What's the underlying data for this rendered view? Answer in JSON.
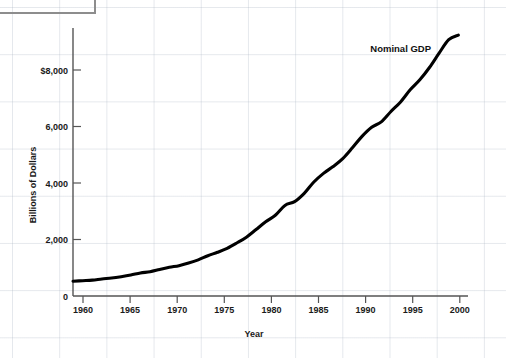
{
  "figure": {
    "background_color": "#ffffff",
    "grid_color": "#aab4c3",
    "line_color": "#000000",
    "text_color": "#1a1a1a"
  },
  "top_box": {
    "name": "cropped-box-outline",
    "border_color": "#8d8d8d"
  },
  "chart_data": {
    "type": "line",
    "title": "",
    "subtitle": "",
    "xlabel": "Year",
    "ylabel": "Billions of Dollars",
    "xlim": [
      1959,
      2000
    ],
    "ylim": [
      0,
      9500
    ],
    "xticks": [
      1960,
      1965,
      1970,
      1975,
      1980,
      1985,
      1990,
      1995,
      2000
    ],
    "xticklabels": [
      "1960",
      "1965",
      "1970",
      "1975",
      "1980",
      "1985",
      "1990",
      "1995",
      "2000"
    ],
    "yticks": [
      0,
      2000,
      4000,
      6000,
      8000
    ],
    "yticklabels": [
      "0",
      "2,000",
      "4,000",
      "6,000",
      "$8,000"
    ],
    "grid": true,
    "legend": "none",
    "annotations": [
      {
        "text": "Nominal GDP",
        "x": 1993.0,
        "y": 8800
      }
    ],
    "series": [
      {
        "name": "Nominal GDP",
        "color": "#000000",
        "x": [
          1959,
          1960,
          1961,
          1962,
          1963,
          1964,
          1965,
          1966,
          1967,
          1968,
          1969,
          1970,
          1971,
          1972,
          1973,
          1974,
          1975,
          1976,
          1977,
          1978,
          1979,
          1980,
          1981,
          1982,
          1983,
          1984,
          1985,
          1986,
          1987,
          1988,
          1989,
          1990,
          1991,
          1992,
          1993,
          1994,
          1995,
          1996,
          1997,
          1998,
          1999
        ],
        "values": [
          522,
          543,
          563,
          605,
          638,
          685,
          743,
          815,
          862,
          943,
          1020,
          1076,
          1168,
          1282,
          1429,
          1549,
          1689,
          1878,
          2086,
          2357,
          2632,
          2863,
          3211,
          3345,
          3638,
          4041,
          4347,
          4590,
          4870,
          5253,
          5658,
          5980,
          6174,
          6539,
          6879,
          7309,
          7664,
          8100,
          8609,
          9089,
          9250
        ]
      }
    ]
  },
  "axes_geometry": {
    "plot_left": 73,
    "plot_right": 468,
    "plot_top": 28,
    "plot_bottom": 296
  }
}
